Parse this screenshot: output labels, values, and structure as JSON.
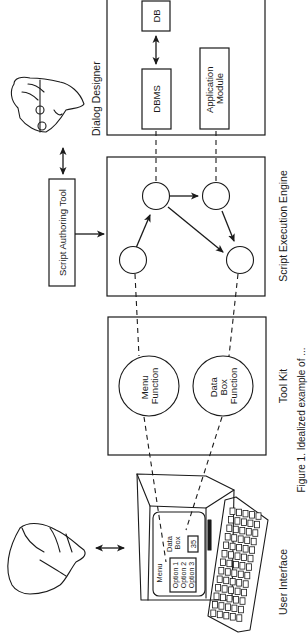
{
  "diagram": {
    "orientation": "rotated-90-cw",
    "sections": {
      "dialog_designer": {
        "label": "Dialog Designer"
      },
      "script_execution_engine": {
        "label": "Script Execution Engine"
      },
      "tool_kit": {
        "label": "Tool Kit"
      },
      "user_interface": {
        "label": "User Interface"
      }
    },
    "components": {
      "db": "DB",
      "dbms": "DBMS",
      "application_module": [
        "Application",
        "Module"
      ],
      "script_authoring_tool": "Script  Authoring Tool",
      "menu_function": [
        "Menu",
        "Function"
      ],
      "data_box_function": [
        "Data",
        "Box",
        "Function"
      ]
    },
    "screen": {
      "menu_label": "Menu",
      "data_box_label": [
        "Data",
        "Box"
      ],
      "data_box_value": "35",
      "options": [
        "Option 1",
        "Option 2",
        "Option 3"
      ]
    },
    "caption": "Figure 1. Idealized example of ..."
  }
}
